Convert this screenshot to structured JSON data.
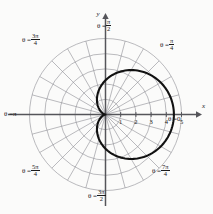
{
  "figure": {
    "type": "polar-plot",
    "background_color": "#fbfbfa",
    "curve_color": "#111111",
    "grid_color": "#8d8d93",
    "axis_color": "#55555a",
    "text_color": "#1a1a1a"
  },
  "axes": {
    "x_label": "x",
    "y_label": "y"
  },
  "angle_labels": [
    {
      "id": "theta-0",
      "lhs": "θ =",
      "value": "0",
      "kind": "plain",
      "degrees": 0
    },
    {
      "id": "theta-pi-4",
      "lhs": "θ =",
      "num": "π",
      "den": "4",
      "kind": "fraction",
      "degrees": 45
    },
    {
      "id": "theta-pi-2",
      "lhs": "θ =",
      "num": "π",
      "den": "2",
      "kind": "fraction",
      "degrees": 90
    },
    {
      "id": "theta-3pi-4",
      "lhs": "θ =",
      "num": "3π",
      "den": "4",
      "kind": "fraction",
      "degrees": 135
    },
    {
      "id": "theta-pi",
      "lhs": "θ =",
      "value": "π",
      "kind": "plain",
      "degrees": 180
    },
    {
      "id": "theta-5pi-4",
      "lhs": "θ =",
      "num": "5π",
      "den": "4",
      "kind": "fraction",
      "degrees": 225
    },
    {
      "id": "theta-3pi-2",
      "lhs": "θ =",
      "num": "3π",
      "den": "2",
      "kind": "fraction",
      "degrees": 270
    },
    {
      "id": "theta-7pi-4",
      "lhs": "θ =",
      "num": "7π",
      "den": "4",
      "kind": "fraction",
      "degrees": 315
    }
  ],
  "chart_data": {
    "type": "line",
    "coordinate_system": "polar",
    "title": "",
    "xlabel": "x",
    "ylabel": "y",
    "grid": true,
    "legend": null,
    "radial_ticks": [
      1,
      2,
      3,
      4,
      5
    ],
    "radial_tick_labels": [
      "1",
      "2",
      "3",
      "4",
      "5"
    ],
    "rlim": [
      0,
      5
    ],
    "grid_circles": 5,
    "angular_gridlines_deg": [
      0,
      15,
      30,
      45,
      60,
      75,
      90,
      105,
      120,
      135,
      150,
      165,
      180,
      195,
      210,
      225,
      240,
      255,
      270,
      285,
      300,
      315,
      330,
      345
    ],
    "angular_gridline_step_deg": 15,
    "curve": {
      "name": "cardioid",
      "equation": "r = 2.25(1 + cos θ)",
      "r_max": 4.5,
      "r_at_theta_0": 4.5,
      "r_at_theta_pi_over_2": 2.25,
      "r_at_theta_pi": 0,
      "cusp_at_origin": true,
      "symmetry": "about the polar axis (x-axis)",
      "points_theta_deg": [
        0,
        15,
        30,
        45,
        60,
        75,
        90,
        105,
        120,
        135,
        150,
        165,
        180,
        195,
        210,
        225,
        240,
        255,
        270,
        285,
        300,
        315,
        330,
        345,
        360
      ],
      "points_r": [
        4.5,
        4.42,
        4.2,
        3.84,
        3.38,
        2.83,
        2.25,
        1.67,
        1.13,
        0.66,
        0.3,
        0.08,
        0.0,
        0.08,
        0.3,
        0.66,
        1.13,
        1.67,
        2.25,
        2.83,
        3.38,
        3.84,
        4.2,
        4.42,
        4.5
      ]
    }
  }
}
